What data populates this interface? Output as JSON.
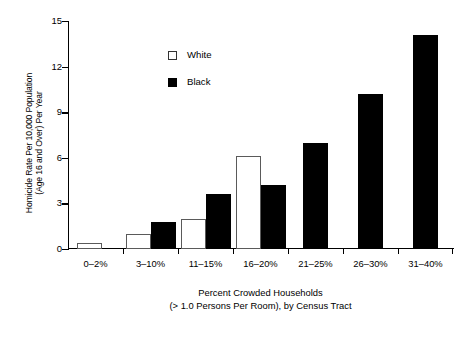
{
  "chart_data": {
    "type": "bar",
    "title": "",
    "xlabel": "Percent Crowded Households (> 1.0 Persons Per Room), by Census Tract",
    "xlabel_lines": [
      "Percent Crowded Households",
      "(> 1.0 Persons Per Room), by Census Tract"
    ],
    "ylabel": "Homicide Rate Per 10,000 Population (Age 16 and Over) Per Year",
    "ylabel_lines": [
      "Homicide Rate Per 10,000 Population",
      "(Age 16 and Over) Per Year"
    ],
    "categories": [
      "0–2%",
      "3–10%",
      "11–15%",
      "16–20%",
      "21–25%",
      "26–30%",
      "31–40%"
    ],
    "series": [
      {
        "name": "White",
        "color": "#ffffff",
        "edge_color": "#5a5a5a",
        "values": [
          0.4,
          1.0,
          2.0,
          6.1,
          null,
          null,
          null
        ]
      },
      {
        "name": "Black",
        "color": "#000000",
        "edge_color": "#000000",
        "values": [
          null,
          1.8,
          3.6,
          4.2,
          7.0,
          10.2,
          14.1
        ]
      }
    ],
    "ylim": [
      0,
      15
    ],
    "yticks": [
      0,
      3,
      6,
      9,
      12,
      15
    ],
    "ytick_labels": [
      "0",
      "3",
      "6",
      "9",
      "12",
      "15"
    ],
    "grid": false,
    "legend_position": "upper-left-inside",
    "legend_entries": [
      "White",
      "Black"
    ]
  },
  "axes": {
    "y_axis_name": "homicide-rate-axis",
    "x_axis_name": "percent-crowded-households-axis"
  }
}
